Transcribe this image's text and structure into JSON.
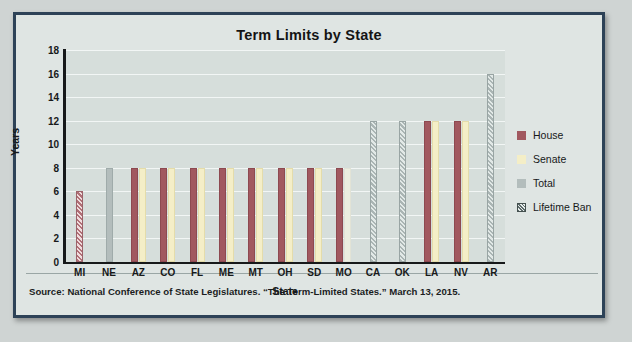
{
  "chart_data": {
    "type": "bar",
    "title": "Term Limits by State",
    "xlabel": "State",
    "ylabel": "Years",
    "ylim": [
      0,
      18
    ],
    "ytick_step": 2,
    "yticks": [
      18,
      16,
      14,
      12,
      10,
      8,
      6,
      4,
      2,
      0
    ],
    "grid": true,
    "legend_position": "right",
    "categories": [
      "MI",
      "NE",
      "AZ",
      "CO",
      "FL",
      "ME",
      "MT",
      "OH",
      "SD",
      "MO",
      "CA",
      "OK",
      "LA",
      "NV",
      "AR"
    ],
    "series": [
      {
        "name": "House",
        "color": "#a1585f",
        "values": [
          null,
          null,
          8,
          8,
          8,
          8,
          8,
          8,
          8,
          8,
          null,
          null,
          12,
          12,
          null
        ]
      },
      {
        "name": "Senate",
        "color": "#f4eec7",
        "values": [
          null,
          null,
          8,
          8,
          8,
          8,
          8,
          8,
          8,
          8,
          null,
          null,
          12,
          12,
          null
        ]
      },
      {
        "name": "Total",
        "color": "#b3bdbc",
        "values": [
          null,
          8,
          null,
          null,
          null,
          null,
          null,
          null,
          null,
          null,
          null,
          null,
          null,
          null,
          null
        ]
      },
      {
        "name": "Lifetime Ban",
        "color": "#5d6a6b",
        "pattern": "hatched",
        "values": [
          6,
          null,
          null,
          null,
          null,
          null,
          null,
          null,
          null,
          null,
          12,
          12,
          null,
          null,
          16
        ]
      }
    ]
  },
  "legend": {
    "items": [
      {
        "label": "House",
        "swatch": "sw-house"
      },
      {
        "label": "Senate",
        "swatch": "sw-senate"
      },
      {
        "label": "Total",
        "swatch": "sw-total"
      },
      {
        "label": "Lifetime Ban",
        "swatch": "sw-ban"
      }
    ]
  },
  "source": {
    "note": "Source: National Conference of State Legislatures. “The Term-Limited States.” March 13, 2015."
  }
}
